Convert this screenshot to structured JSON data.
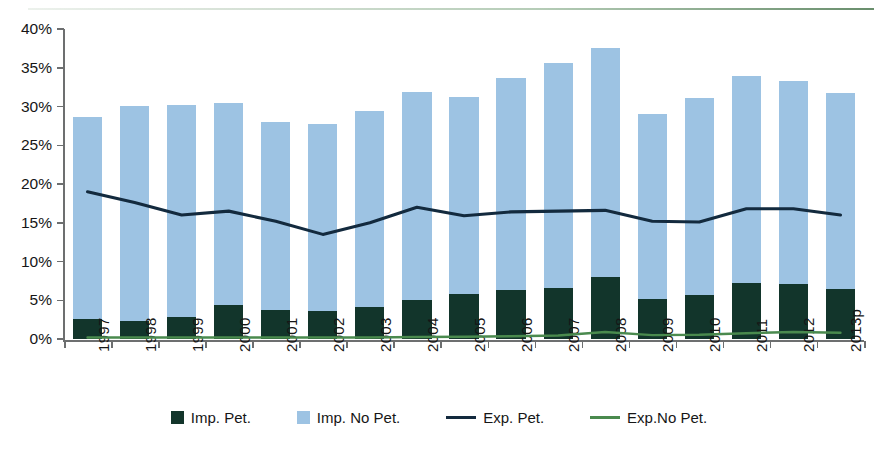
{
  "chart_data": {
    "type": "bar",
    "title": "",
    "subtitle": "",
    "xlabel": "",
    "ylabel": "",
    "ylim": [
      0,
      40
    ],
    "ytick_values": [
      0,
      5,
      10,
      15,
      20,
      25,
      30,
      35,
      40
    ],
    "ytick_labels": [
      "0%",
      "5%",
      "10%",
      "15%",
      "20%",
      "25%",
      "30%",
      "35%",
      "40%"
    ],
    "grid": false,
    "legend_position": "bottom",
    "stacked": true,
    "categories": [
      "1997",
      "1998",
      "1999",
      "2000",
      "2001",
      "2002",
      "2003",
      "2004",
      "2005",
      "2006",
      "2007",
      "2008",
      "2009",
      "2010",
      "2011",
      "2012",
      "2013p"
    ],
    "series": [
      {
        "name": "Imp. Pet.",
        "type": "bar",
        "color": "#12352b",
        "values": [
          2.6,
          2.3,
          2.8,
          4.4,
          3.8,
          3.6,
          4.1,
          5.0,
          5.8,
          6.3,
          6.6,
          8.0,
          5.2,
          5.7,
          7.2,
          7.1,
          6.5
        ]
      },
      {
        "name": "Imp. No Pet.",
        "type": "bar",
        "color": "#9dc3e3",
        "values": [
          26.1,
          27.8,
          27.4,
          26.0,
          24.2,
          24.1,
          25.3,
          26.9,
          25.4,
          27.4,
          29.0,
          29.5,
          23.8,
          25.4,
          26.8,
          26.2,
          25.2
        ]
      },
      {
        "name": "Imp. Total",
        "type": "bar-total",
        "color": "#9dc3e3",
        "values": [
          28.7,
          30.1,
          30.2,
          30.4,
          28.0,
          27.7,
          29.4,
          31.9,
          31.2,
          33.7,
          35.6,
          37.5,
          29.0,
          31.1,
          34.0,
          33.3,
          31.7
        ]
      },
      {
        "name": "Exp. Pet.",
        "type": "line",
        "color": "#132a3e",
        "values": [
          19.0,
          17.6,
          16.0,
          16.5,
          15.2,
          13.5,
          15.0,
          17.0,
          15.9,
          16.4,
          16.5,
          16.6,
          15.2,
          15.1,
          16.8,
          16.8,
          16.0
        ]
      },
      {
        "name": "Exp.No Pet.",
        "type": "line",
        "color": "#4a8a4e",
        "values": [
          0.2,
          0.2,
          0.2,
          0.2,
          0.2,
          0.2,
          0.2,
          0.25,
          0.3,
          0.35,
          0.45,
          0.9,
          0.5,
          0.55,
          0.75,
          0.9,
          0.8
        ]
      }
    ],
    "legend": [
      {
        "label": "Imp. Pet.",
        "marker": "square",
        "color": "#12352b"
      },
      {
        "label": "Imp. No Pet.",
        "marker": "square",
        "color": "#9dc3e3"
      },
      {
        "label": "Exp. Pet.",
        "marker": "line",
        "color": "#132a3e"
      },
      {
        "label": "Exp.No Pet.",
        "marker": "line",
        "color": "#4a8a4e"
      }
    ]
  },
  "colors": {
    "axis": "#6d6f70",
    "text": "#161616",
    "background": "#ffffff",
    "bar_petroleum": "#12352b",
    "bar_no_petroleum": "#9dc3e3",
    "line_exp_petroleum": "#132a3e",
    "line_exp_no_petroleum": "#4a8a4e",
    "top_rule": "#4e7a52"
  }
}
